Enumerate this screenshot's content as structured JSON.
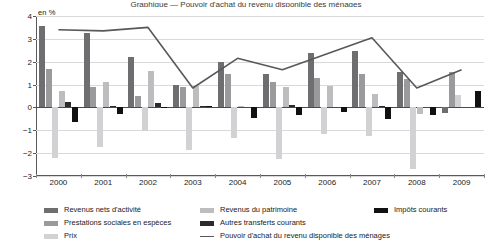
{
  "title_sliver": "Graphique — Pouvoir d'achat du revenu disponible des ménages",
  "axis": {
    "unit_label": "en %",
    "y_ticks": [
      "4",
      "3",
      "2",
      "1",
      "0",
      "-1",
      "-2",
      "-3"
    ],
    "y_min": -3,
    "y_max": 4,
    "x_labels": [
      "2000",
      "2001",
      "2002",
      "2003",
      "2004",
      "2005",
      "2006",
      "2007",
      "2008",
      "2009"
    ]
  },
  "colors": {
    "revenus_nets": "#6e6e70",
    "prestations": "#9a9a9c",
    "prix": "#d2d2d4",
    "patrimoine": "#bdbdbf",
    "transferts": "#2b2b2d",
    "impots": "#111113",
    "line": "#58585a",
    "grid": "#d9d9d9",
    "axis": "#5a5a5a"
  },
  "legend": {
    "col1": [
      {
        "key": "revenus_nets",
        "label": "Revenus nets d'activité",
        "type": "bar"
      },
      {
        "key": "prestations",
        "label": "Prestations sociales en espèces",
        "type": "bar"
      },
      {
        "key": "prix",
        "label": "Prix",
        "type": "bar"
      }
    ],
    "col2": [
      {
        "key": "patrimoine",
        "label": "Revenus du patrimoine",
        "type": "bar"
      },
      {
        "key": "transferts",
        "label": "Autres transferts courants",
        "type": "bar"
      },
      {
        "key": "line",
        "label": "Pouvoir d'achat du revenu disponible des ménages",
        "type": "line"
      }
    ],
    "col3": [
      {
        "key": "impots",
        "label": "Impôts courants",
        "type": "bar"
      }
    ]
  },
  "chart_data": {
    "type": "bar",
    "title": "Pouvoir d'achat du revenu disponible des ménages",
    "xlabel": "",
    "ylabel": "en %",
    "ylim": [
      -3,
      4
    ],
    "grid": true,
    "legend_position": "bottom",
    "categories": [
      "2000",
      "2001",
      "2002",
      "2003",
      "2004",
      "2005",
      "2006",
      "2007",
      "2008",
      "2009"
    ],
    "series": [
      {
        "name": "Revenus nets d'activité",
        "type": "bar",
        "color": "#6e6e70",
        "values": [
          3.55,
          3.25,
          2.2,
          1.0,
          2.0,
          1.45,
          2.4,
          2.45,
          1.55,
          -0.25
        ]
      },
      {
        "name": "Prestations sociales en espèces",
        "type": "bar",
        "color": "#9a9a9c",
        "values": [
          1.7,
          0.9,
          0.5,
          0.9,
          1.45,
          1.1,
          1.3,
          1.45,
          1.25,
          1.55
        ]
      },
      {
        "name": "Prix",
        "type": "bar",
        "color": "#d2d2d4",
        "values": [
          -2.2,
          -1.75,
          -1.05,
          -1.85,
          -1.35,
          -2.25,
          -1.15,
          -1.25,
          -2.7,
          0.55
        ]
      },
      {
        "name": "Revenus du patrimoine",
        "type": "bar",
        "color": "#bdbdbf",
        "values": [
          0.72,
          1.1,
          1.6,
          0.95,
          0.05,
          0.9,
          0.95,
          0.6,
          -0.3,
          0.0
        ]
      },
      {
        "name": "Autres transferts courants",
        "type": "bar",
        "color": "#2b2b2d",
        "values": [
          0.22,
          0.08,
          0.2,
          0.05,
          0.0,
          0.1,
          0.0,
          0.08,
          0.0,
          0.0
        ]
      },
      {
        "name": "Impôts courants",
        "type": "bar",
        "color": "#111113",
        "values": [
          -0.62,
          -0.3,
          0.02,
          0.05,
          -0.45,
          -0.35,
          -0.22,
          -0.52,
          -0.35,
          0.72
        ]
      },
      {
        "name": "Pouvoir d'achat du revenu disponible des ménages",
        "type": "line",
        "color": "#58585a",
        "values": [
          3.4,
          3.35,
          3.5,
          0.85,
          2.15,
          1.65,
          2.35,
          3.05,
          0.85,
          1.65
        ]
      }
    ]
  }
}
